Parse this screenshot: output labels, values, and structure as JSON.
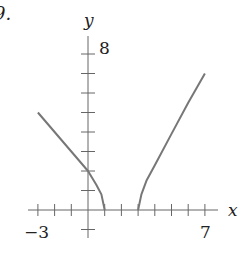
{
  "problem_label": "9.",
  "chart_data": {
    "type": "line",
    "title": "",
    "xlabel": "x",
    "ylabel": "y",
    "xlim": [
      -3,
      7
    ],
    "ylim": [
      -1,
      8
    ],
    "x_tick_labels": [
      "-3",
      "7"
    ],
    "y_tick_labels": [
      "8"
    ],
    "x_ticks": [
      -3,
      -2,
      -1,
      0,
      1,
      2,
      3,
      4,
      5,
      6,
      7
    ],
    "y_ticks": [
      -1,
      0,
      1,
      2,
      3,
      4,
      5,
      6,
      7,
      8
    ],
    "grid": false,
    "legend": null,
    "series": [
      {
        "name": "left-branch",
        "points": [
          [
            -3,
            5.0
          ],
          [
            -2,
            4.0
          ],
          [
            -1,
            3.0
          ],
          [
            0,
            2.0
          ],
          [
            0.5,
            1.3
          ],
          [
            0.8,
            0.8
          ],
          [
            1,
            0
          ]
        ]
      },
      {
        "name": "right-branch",
        "points": [
          [
            3,
            0
          ],
          [
            3.2,
            0.8
          ],
          [
            3.5,
            1.5
          ],
          [
            4,
            2.3
          ],
          [
            5,
            3.9
          ],
          [
            6,
            5.5
          ],
          [
            7,
            7.0
          ]
        ]
      }
    ],
    "color": "#777777"
  }
}
